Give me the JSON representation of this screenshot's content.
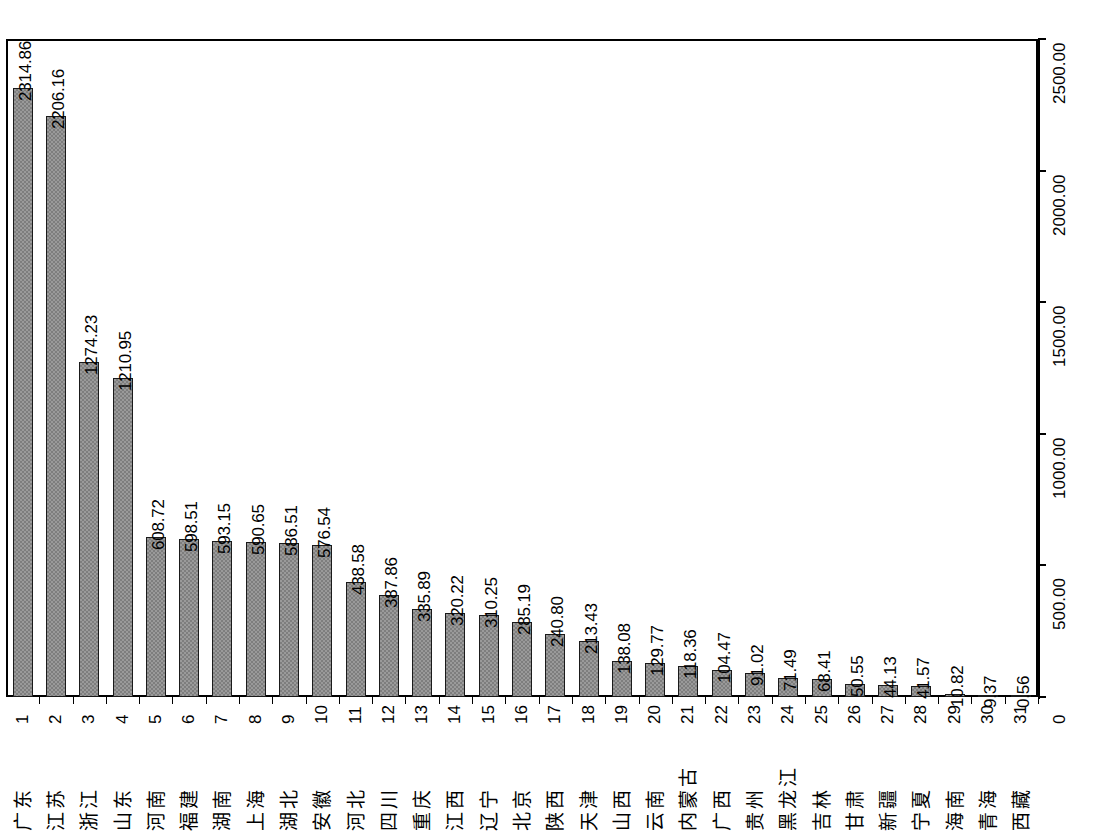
{
  "chart_data": {
    "type": "bar",
    "title": "",
    "subtitle": "",
    "xlabel": "",
    "ylabel": "",
    "orientation": "rotated-90",
    "grid": false,
    "legend": null,
    "value_axis": {
      "min": 0,
      "max": 2500,
      "tick_labels": [
        "0",
        "500.00",
        "1000.00",
        "1500.00",
        "2000.00",
        "2500.00"
      ],
      "tick_values": [
        0,
        500,
        1000,
        1500,
        2000,
        2500
      ],
      "position": "right"
    },
    "category_axis": {
      "indices": [
        "1",
        "2",
        "3",
        "4",
        "5",
        "6",
        "7",
        "8",
        "9",
        "10",
        "11",
        "12",
        "13",
        "14",
        "15",
        "16",
        "17",
        "18",
        "19",
        "20",
        "21",
        "22",
        "23",
        "24",
        "25",
        "26",
        "27",
        "28",
        "29",
        "30",
        "31"
      ],
      "position": "bottom"
    },
    "categories": [
      "广东",
      "江苏",
      "浙江",
      "山东",
      "河南",
      "福建",
      "湖南",
      "上海",
      "湖北",
      "安徽",
      "河北",
      "四川",
      "重庆",
      "江西",
      "辽宁",
      "北京",
      "陕西",
      "天津",
      "山西",
      "云南",
      "内蒙古",
      "广西",
      "贵州",
      "黑龙江",
      "吉林",
      "甘肃",
      "新疆",
      "宁夏",
      "海南",
      "青海",
      "西藏"
    ],
    "values": [
      2314.86,
      2206.16,
      1274.23,
      1210.95,
      608.72,
      598.51,
      593.15,
      590.65,
      586.51,
      576.54,
      438.58,
      387.86,
      335.89,
      320.22,
      310.25,
      285.19,
      240.8,
      213.43,
      138.08,
      129.77,
      118.36,
      104.47,
      91.02,
      71.49,
      68.41,
      50.55,
      44.13,
      41.57,
      10.82,
      9.37,
      0.56
    ],
    "value_labels": [
      "2314.86",
      "2206.16",
      "1274.23",
      "1210.95",
      "608.72",
      "598.51",
      "593.15",
      "590.65",
      "586.51",
      "576.54",
      "438.58",
      "387.86",
      "335.89",
      "320.22",
      "310.25",
      "285.19",
      "240.80",
      "213.43",
      "138.08",
      "129.77",
      "118.36",
      "104.47",
      "91.02",
      "71.49",
      "68.41",
      "50.55",
      "44.13",
      "41.57",
      "10.82",
      "9.37",
      "0.56"
    ],
    "colors": {
      "bar_fill": "#9a9a9a",
      "bar_hatch": "#7e7e7e",
      "bar_border": "#1a1a1a",
      "axis": "#000000",
      "background": "#ffffff",
      "text": "#000000"
    }
  }
}
